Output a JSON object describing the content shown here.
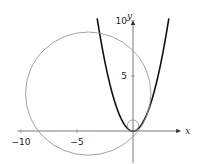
{
  "chart_data": {
    "type": "line",
    "title": "",
    "xlabel": "x",
    "ylabel": "y",
    "xlim": [
      -11,
      4.5
    ],
    "ylim": [
      -3,
      11
    ],
    "x_ticks": [
      -10,
      -5
    ],
    "y_ticks": [
      5,
      10
    ],
    "x_tick_labels": [
      "−10",
      "−5"
    ],
    "y_tick_labels": [
      "5",
      "10"
    ],
    "grid": false,
    "series": [
      {
        "name": "parabola",
        "kind": "function",
        "expr": "y = x^2",
        "x_range": [
          -3.2,
          3.2
        ],
        "color": "#111111"
      },
      {
        "name": "large-circle",
        "kind": "circle",
        "center": [
          -4,
          3.4
        ],
        "radius": 5.6,
        "color": "#999999"
      },
      {
        "name": "osculating-circle",
        "kind": "circle",
        "center": [
          0,
          0.5
        ],
        "radius": 0.5,
        "color": "#999999"
      }
    ]
  }
}
